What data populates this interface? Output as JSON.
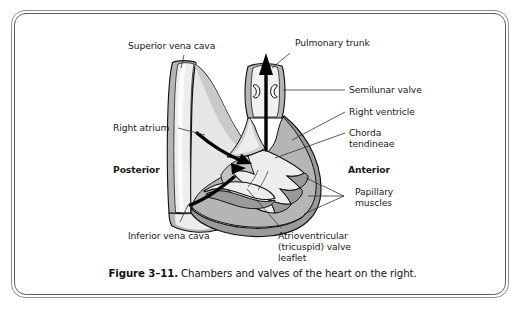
{
  "figure": {
    "caption_number": "Figure 3–11.",
    "caption_text": "Chambers and valves of the heart on the right.",
    "title": "Chambers and valves of the heart on the right"
  },
  "labels": {
    "superior_vena_cava": "Superior vena cava",
    "pulmonary_trunk": "Pulmonary trunk",
    "semilunar_valve": "Semilunar valve",
    "right_ventricle": "Right ventricle",
    "chorda_tendineae_line1": "Chorda",
    "chorda_tendineae_line2": "tendineae",
    "right_atrium": "Right atrium",
    "posterior": "Posterior",
    "anterior": "Anterior",
    "papillary_muscles_line1": "Papillary",
    "papillary_muscles_line2": "muscles",
    "inferior_vena_cava": "Inferior vena cava",
    "atrioventricular_line1": "Atrioventricular",
    "atrioventricular_line2": "(tricuspid) valve",
    "atrioventricular_line3": "leaflet"
  },
  "colors": {
    "page_background": "#ffffff",
    "frame_outer": "#8d8d8d",
    "frame_inner": "#5e5e5e",
    "outline": "#111111",
    "chamber_light": "#e6e6e6",
    "chamber_lighter": "#f1f1f1",
    "muscle_mid": "#b5b5b5",
    "muscle_dark": "#9a9a9a",
    "highlight_white": "#fcfcfc",
    "text": "#1a1a1a",
    "flow_arrow": "#000000"
  },
  "diagram": {
    "type": "anatomical-illustration",
    "structures": [
      "superior vena cava",
      "inferior vena cava",
      "right atrium",
      "right ventricle",
      "pulmonary trunk",
      "semilunar valve",
      "atrioventricular (tricuspid) valve leaflet",
      "chorda tendineae",
      "papillary muscles"
    ],
    "orientation": {
      "left": "Posterior",
      "right": "Anterior"
    },
    "blood_flow_arrows": 3,
    "flow_description": "two curved arrows from right atrium into right ventricle, one straight arrow upward out the pulmonary trunk"
  }
}
